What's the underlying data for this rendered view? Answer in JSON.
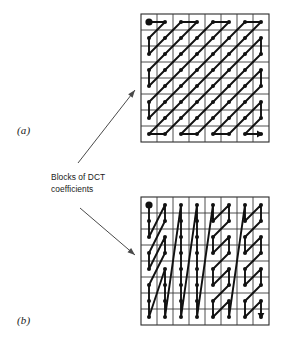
{
  "figure": {
    "background_color": "#ffffff",
    "ink_color": "#111111",
    "grid_color": "#3b3b3b",
    "arrow_color": "#4a4a4a"
  },
  "caption": {
    "line1": "Blocks of DCT",
    "line2": "coefficients"
  },
  "panels": [
    {
      "id": "a",
      "label": "(a)",
      "scan_name": "zigzag-scan",
      "grid": {
        "x": 141,
        "y": 14,
        "size": 128,
        "cells": 8
      },
      "order": [
        [
          0,
          0
        ],
        [
          1,
          0
        ],
        [
          0,
          1
        ],
        [
          0,
          2
        ],
        [
          1,
          1
        ],
        [
          2,
          0
        ],
        [
          3,
          0
        ],
        [
          2,
          1
        ],
        [
          1,
          2
        ],
        [
          0,
          3
        ],
        [
          0,
          4
        ],
        [
          1,
          3
        ],
        [
          2,
          2
        ],
        [
          3,
          1
        ],
        [
          4,
          0
        ],
        [
          5,
          0
        ],
        [
          4,
          1
        ],
        [
          3,
          2
        ],
        [
          2,
          3
        ],
        [
          1,
          4
        ],
        [
          0,
          5
        ],
        [
          0,
          6
        ],
        [
          1,
          5
        ],
        [
          2,
          4
        ],
        [
          3,
          3
        ],
        [
          4,
          2
        ],
        [
          5,
          1
        ],
        [
          6,
          0
        ],
        [
          7,
          0
        ],
        [
          6,
          1
        ],
        [
          5,
          2
        ],
        [
          4,
          3
        ],
        [
          3,
          4
        ],
        [
          2,
          5
        ],
        [
          1,
          6
        ],
        [
          0,
          7
        ],
        [
          1,
          7
        ],
        [
          2,
          6
        ],
        [
          3,
          5
        ],
        [
          4,
          4
        ],
        [
          5,
          3
        ],
        [
          6,
          2
        ],
        [
          7,
          1
        ],
        [
          7,
          2
        ],
        [
          6,
          3
        ],
        [
          5,
          4
        ],
        [
          4,
          5
        ],
        [
          3,
          6
        ],
        [
          2,
          7
        ],
        [
          3,
          7
        ],
        [
          4,
          6
        ],
        [
          5,
          5
        ],
        [
          6,
          4
        ],
        [
          7,
          3
        ],
        [
          7,
          4
        ],
        [
          6,
          5
        ],
        [
          5,
          6
        ],
        [
          4,
          7
        ],
        [
          5,
          7
        ],
        [
          6,
          6
        ],
        [
          7,
          5
        ],
        [
          7,
          6
        ],
        [
          6,
          7
        ],
        [
          7,
          7
        ]
      ]
    },
    {
      "id": "b",
      "label": "(b)",
      "scan_name": "alternate-scan",
      "grid": {
        "x": 141,
        "y": 197,
        "size": 128,
        "cells": 8
      },
      "order": [
        [
          0,
          0
        ],
        [
          0,
          1
        ],
        [
          0,
          2
        ],
        [
          1,
          0
        ],
        [
          1,
          1
        ],
        [
          0,
          3
        ],
        [
          0,
          4
        ],
        [
          1,
          2
        ],
        [
          1,
          3
        ],
        [
          0,
          5
        ],
        [
          0,
          6
        ],
        [
          0,
          7
        ],
        [
          1,
          4
        ],
        [
          1,
          5
        ],
        [
          1,
          6
        ],
        [
          1,
          7
        ],
        [
          2,
          0
        ],
        [
          2,
          1
        ],
        [
          2,
          2
        ],
        [
          2,
          3
        ],
        [
          2,
          4
        ],
        [
          2,
          5
        ],
        [
          2,
          6
        ],
        [
          2,
          7
        ],
        [
          3,
          0
        ],
        [
          3,
          1
        ],
        [
          3,
          2
        ],
        [
          3,
          3
        ],
        [
          3,
          4
        ],
        [
          3,
          5
        ],
        [
          3,
          6
        ],
        [
          3,
          7
        ],
        [
          4,
          0
        ],
        [
          4,
          1
        ],
        [
          5,
          0
        ],
        [
          5,
          1
        ],
        [
          4,
          2
        ],
        [
          4,
          3
        ],
        [
          5,
          2
        ],
        [
          5,
          3
        ],
        [
          4,
          4
        ],
        [
          4,
          5
        ],
        [
          5,
          4
        ],
        [
          5,
          5
        ],
        [
          4,
          6
        ],
        [
          4,
          7
        ],
        [
          5,
          6
        ],
        [
          5,
          7
        ],
        [
          6,
          0
        ],
        [
          6,
          1
        ],
        [
          7,
          0
        ],
        [
          7,
          1
        ],
        [
          6,
          2
        ],
        [
          6,
          3
        ],
        [
          7,
          2
        ],
        [
          7,
          3
        ],
        [
          6,
          4
        ],
        [
          6,
          5
        ],
        [
          7,
          4
        ],
        [
          7,
          5
        ],
        [
          6,
          6
        ],
        [
          6,
          7
        ],
        [
          7,
          6
        ],
        [
          7,
          7
        ]
      ]
    }
  ],
  "arrows": [
    {
      "name": "arrow-to-panel-a",
      "x1": 78,
      "y1": 163,
      "x2": 135,
      "y2": 90
    },
    {
      "name": "arrow-to-panel-b",
      "x1": 80,
      "y1": 208,
      "x2": 135,
      "y2": 255
    }
  ]
}
